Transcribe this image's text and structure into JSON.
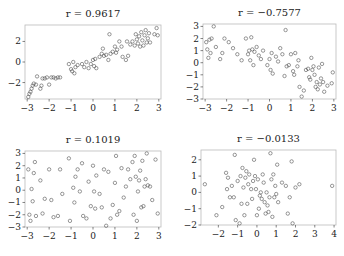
{
  "chart_data": [
    {
      "type": "scatter",
      "title": "r = 0.9617",
      "xlabel": "",
      "ylabel": "",
      "xlim": [
        -3.1,
        3.1
      ],
      "ylim": [
        -3.6,
        3.6
      ],
      "xticks": [
        -3,
        -2,
        -1,
        0,
        1,
        2,
        3
      ],
      "yticks": [
        -2,
        0,
        2
      ],
      "xtick_labels": [
        "−3",
        "−2",
        "−1",
        "0",
        "1",
        "2",
        "3"
      ],
      "ytick_labels": [
        "−2",
        "0",
        "2"
      ],
      "box": [
        25,
        25,
        161,
        99
      ],
      "points": [
        [
          -2.95,
          -3.4
        ],
        [
          -2.9,
          -3.1
        ],
        [
          -2.85,
          -2.9
        ],
        [
          -2.8,
          -2.6
        ],
        [
          -2.75,
          -2.3
        ],
        [
          -2.7,
          -2.1
        ],
        [
          -2.6,
          -2.2
        ],
        [
          -2.55,
          -1.4
        ],
        [
          -2.4,
          -2.6
        ],
        [
          -2.35,
          -2.3
        ],
        [
          -2.3,
          -1.6
        ],
        [
          -2.2,
          -1.6
        ],
        [
          -2.1,
          -1.5
        ],
        [
          -2.0,
          -2.2
        ],
        [
          -1.9,
          -1.5
        ],
        [
          -1.8,
          -1.5
        ],
        [
          -1.7,
          -1.6
        ],
        [
          -1.6,
          -1.5
        ],
        [
          -1.5,
          -1.5
        ],
        [
          -1.1,
          -0.2
        ],
        [
          -1.0,
          -0.7
        ],
        [
          -0.95,
          -0.9
        ],
        [
          -0.9,
          0.0
        ],
        [
          -0.85,
          -1.1
        ],
        [
          -0.8,
          -0.5
        ],
        [
          -0.7,
          -0.3
        ],
        [
          -0.5,
          -0.2
        ],
        [
          -0.4,
          -0.5
        ],
        [
          -0.3,
          0.0
        ],
        [
          -0.2,
          -0.6
        ],
        [
          -0.1,
          -0.2
        ],
        [
          0.0,
          0.2
        ],
        [
          0.05,
          -0.4
        ],
        [
          0.1,
          0.3
        ],
        [
          0.15,
          -0.6
        ],
        [
          0.3,
          0.5
        ],
        [
          0.4,
          0.8
        ],
        [
          0.45,
          1.3
        ],
        [
          0.5,
          0.6
        ],
        [
          0.6,
          0.7
        ],
        [
          0.7,
          0.2
        ],
        [
          0.75,
          2.7
        ],
        [
          0.8,
          0.8
        ],
        [
          0.9,
          1.0
        ],
        [
          1.0,
          1.5
        ],
        [
          1.05,
          0.9
        ],
        [
          1.1,
          1.2
        ],
        [
          1.2,
          2.0
        ],
        [
          1.3,
          1.5
        ],
        [
          1.35,
          0.5
        ],
        [
          1.5,
          0.2
        ],
        [
          1.55,
          2.0
        ],
        [
          1.6,
          0.6
        ],
        [
          1.7,
          1.7
        ],
        [
          1.8,
          2.0
        ],
        [
          1.9,
          1.6
        ],
        [
          1.95,
          2.7
        ],
        [
          2.0,
          2.2
        ],
        [
          2.05,
          1.8
        ],
        [
          2.1,
          2.5
        ],
        [
          2.15,
          1.5
        ],
        [
          2.2,
          2.9
        ],
        [
          2.25,
          2.1
        ],
        [
          2.3,
          1.6
        ],
        [
          2.35,
          2.6
        ],
        [
          2.4,
          3.1
        ],
        [
          2.45,
          1.9
        ],
        [
          2.5,
          2.3
        ],
        [
          2.55,
          2.8
        ],
        [
          2.6,
          1.9
        ],
        [
          2.8,
          2.7
        ],
        [
          2.9,
          3.3
        ],
        [
          2.95,
          2.6
        ]
      ]
    },
    {
      "type": "scatter",
      "title": "r = −0.7577",
      "xlabel": "",
      "ylabel": "",
      "xlim": [
        -3.1,
        3.1
      ],
      "ylim": [
        -3.0,
        3.2
      ],
      "xticks": [
        -3,
        -2,
        -1,
        0,
        1,
        2,
        3
      ],
      "yticks": [
        -3,
        -2,
        -1,
        0,
        1,
        2,
        3
      ],
      "xtick_labels": [
        "−3",
        "−2",
        "−1",
        "0",
        "1",
        "2",
        "3"
      ],
      "ytick_labels": [
        "−3",
        "−2",
        "−1",
        "0",
        "1",
        "2",
        "3"
      ],
      "box": [
        203,
        24,
        336,
        99
      ],
      "points": [
        [
          -2.95,
          1.7
        ],
        [
          -2.9,
          1.1
        ],
        [
          -2.85,
          0.4
        ],
        [
          -2.8,
          1.9
        ],
        [
          -2.75,
          0.8
        ],
        [
          -2.7,
          2.0
        ],
        [
          -2.6,
          3.0
        ],
        [
          -2.5,
          1.3
        ],
        [
          -2.3,
          0.3
        ],
        [
          -2.2,
          0.8
        ],
        [
          -2.1,
          2.0
        ],
        [
          -1.9,
          1.7
        ],
        [
          -1.7,
          1.2
        ],
        [
          -1.5,
          0.7
        ],
        [
          -1.3,
          0.2
        ],
        [
          -1.1,
          2.0
        ],
        [
          -1.0,
          0.7
        ],
        [
          -0.95,
          1.0
        ],
        [
          -0.9,
          0.2
        ],
        [
          -0.85,
          2.1
        ],
        [
          -0.8,
          1.1
        ],
        [
          -0.75,
          -0.2
        ],
        [
          -0.7,
          0.9
        ],
        [
          -0.6,
          1.3
        ],
        [
          -0.5,
          0.6
        ],
        [
          -0.4,
          0.3
        ],
        [
          -0.3,
          1.0
        ],
        [
          -0.1,
          -0.2
        ],
        [
          0.0,
          0.3
        ],
        [
          0.05,
          -0.6
        ],
        [
          0.1,
          0.8
        ],
        [
          0.15,
          -0.9
        ],
        [
          0.3,
          0.5
        ],
        [
          0.4,
          0.1
        ],
        [
          0.5,
          1.2
        ],
        [
          0.6,
          0.7
        ],
        [
          0.7,
          -1.1
        ],
        [
          0.75,
          2.7
        ],
        [
          0.8,
          -0.3
        ],
        [
          0.9,
          -0.2
        ],
        [
          1.0,
          0.7
        ],
        [
          1.1,
          -0.7
        ],
        [
          1.15,
          -1.0
        ],
        [
          1.2,
          0.8
        ],
        [
          1.3,
          -0.3
        ],
        [
          1.35,
          0.2
        ],
        [
          1.4,
          -2.0
        ],
        [
          1.5,
          -2.8
        ],
        [
          1.6,
          -2.3
        ],
        [
          1.7,
          -0.6
        ],
        [
          1.8,
          -0.5
        ],
        [
          1.85,
          -1.2
        ],
        [
          1.9,
          -1.4
        ],
        [
          1.95,
          0.4
        ],
        [
          2.0,
          -0.6
        ],
        [
          2.05,
          -0.3
        ],
        [
          2.1,
          -1.0
        ],
        [
          2.15,
          -2.0
        ],
        [
          2.2,
          -1.6
        ],
        [
          2.25,
          -2.2
        ],
        [
          2.3,
          -0.4
        ],
        [
          2.35,
          -1.8
        ],
        [
          2.4,
          -1.3
        ],
        [
          2.45,
          -0.1
        ],
        [
          2.5,
          -1.6
        ],
        [
          2.55,
          -2.4
        ],
        [
          2.7,
          -1.9
        ],
        [
          2.9,
          -1.7
        ],
        [
          2.95,
          -0.8
        ]
      ]
    },
    {
      "type": "scatter",
      "title": "r = 0.1019",
      "xlabel": "",
      "ylabel": "",
      "xlim": [
        -3.1,
        3.1
      ],
      "ylim": [
        -3.0,
        3.2
      ],
      "xticks": [
        -3,
        -2,
        -1,
        0,
        1,
        2,
        3
      ],
      "yticks": [
        -3,
        -2,
        -1,
        0,
        1,
        2,
        3
      ],
      "xtick_labels": [
        "−3",
        "−2",
        "−1",
        "0",
        "1",
        "2",
        "3"
      ],
      "ytick_labels": [
        "−3",
        "−2",
        "−1",
        "0",
        "1",
        "2",
        "3"
      ],
      "box": [
        25,
        151,
        161,
        227
      ],
      "points": [
        [
          -2.95,
          1.7
        ],
        [
          -2.9,
          -2.0
        ],
        [
          -2.85,
          -2.5
        ],
        [
          -2.8,
          0.1
        ],
        [
          -2.75,
          -0.9
        ],
        [
          -2.7,
          1.4
        ],
        [
          -2.65,
          2.3
        ],
        [
          -2.6,
          -2.1
        ],
        [
          -2.4,
          0.8
        ],
        [
          -2.3,
          -1.9
        ],
        [
          -2.2,
          -0.7
        ],
        [
          -2.0,
          1.7
        ],
        [
          -1.9,
          -0.8
        ],
        [
          -1.8,
          -2.2
        ],
        [
          -1.6,
          -2.1
        ],
        [
          -1.5,
          1.7
        ],
        [
          -1.4,
          -0.3
        ],
        [
          -1.1,
          2.6
        ],
        [
          -1.05,
          -2.5
        ],
        [
          -0.9,
          0.2
        ],
        [
          -0.85,
          -1.0
        ],
        [
          -0.8,
          1.1
        ],
        [
          -0.7,
          1.7
        ],
        [
          -0.6,
          -0.1
        ],
        [
          -0.5,
          2.2
        ],
        [
          -0.45,
          -2.1
        ],
        [
          -0.3,
          -2.3
        ],
        [
          -0.2,
          0.7
        ],
        [
          -0.1,
          -1.3
        ],
        [
          0.0,
          2.0
        ],
        [
          0.05,
          -0.1
        ],
        [
          0.1,
          -1.5
        ],
        [
          0.15,
          1.2
        ],
        [
          0.3,
          -0.3
        ],
        [
          0.4,
          -1.4
        ],
        [
          0.5,
          1.7
        ],
        [
          0.6,
          -2.9
        ],
        [
          0.7,
          1.5
        ],
        [
          0.8,
          -2.3
        ],
        [
          0.9,
          -1.2
        ],
        [
          1.0,
          0.6
        ],
        [
          1.05,
          2.8
        ],
        [
          1.1,
          -2.0
        ],
        [
          1.2,
          -1.7
        ],
        [
          1.3,
          1.8
        ],
        [
          1.4,
          -0.6
        ],
        [
          1.5,
          0.3
        ],
        [
          1.6,
          1.7
        ],
        [
          1.7,
          0.9
        ],
        [
          1.8,
          2.3
        ],
        [
          1.85,
          -2.0
        ],
        [
          1.9,
          2.8
        ],
        [
          1.95,
          1.1
        ],
        [
          2.0,
          -2.5
        ],
        [
          2.05,
          -0.1
        ],
        [
          2.1,
          0.8
        ],
        [
          2.15,
          1.6
        ],
        [
          2.2,
          -1.4
        ],
        [
          2.25,
          2.4
        ],
        [
          2.3,
          -1.3
        ],
        [
          2.35,
          0.3
        ],
        [
          2.4,
          0.9
        ],
        [
          2.45,
          3.0
        ],
        [
          2.5,
          0.4
        ],
        [
          2.6,
          0.3
        ],
        [
          2.7,
          -0.8
        ],
        [
          2.85,
          2.5
        ],
        [
          2.95,
          -1.9
        ]
      ]
    },
    {
      "type": "scatter",
      "title": "r = −0.0133",
      "xlabel": "",
      "ylabel": "",
      "xlim": [
        -2.9,
        4.1
      ],
      "ylim": [
        -2.0,
        2.6
      ],
      "xticks": [
        -2,
        -1,
        0,
        1,
        2,
        3,
        4
      ],
      "yticks": [
        -2,
        -1,
        0,
        1,
        2
      ],
      "xtick_labels": [
        "−2",
        "−1",
        "0",
        "1",
        "2",
        "3",
        "4"
      ],
      "ytick_labels": [
        "−2",
        "−1",
        "0",
        "1",
        "2"
      ],
      "box": [
        201,
        150,
        336,
        225
      ],
      "points": [
        [
          -2.7,
          0.5
        ],
        [
          -2.1,
          -1.4
        ],
        [
          -1.8,
          -0.9
        ],
        [
          -1.6,
          1.2
        ],
        [
          -1.55,
          0.2
        ],
        [
          -1.5,
          0.9
        ],
        [
          -1.4,
          -0.3
        ],
        [
          -1.3,
          0.4
        ],
        [
          -1.2,
          -0.3
        ],
        [
          -1.15,
          2.3
        ],
        [
          -1.1,
          -1.7
        ],
        [
          -1.0,
          0.7
        ],
        [
          -0.9,
          -1.9
        ],
        [
          -0.85,
          1.0
        ],
        [
          -0.8,
          -0.7
        ],
        [
          -0.75,
          1.5
        ],
        [
          -0.7,
          0.3
        ],
        [
          -0.65,
          -1.4
        ],
        [
          -0.6,
          0.9
        ],
        [
          -0.55,
          1.3
        ],
        [
          -0.5,
          -0.7
        ],
        [
          -0.45,
          0.5
        ],
        [
          -0.4,
          1.1
        ],
        [
          -0.3,
          0.2
        ],
        [
          -0.25,
          -0.4
        ],
        [
          -0.2,
          0.7
        ],
        [
          -0.15,
          2.0
        ],
        [
          -0.1,
          1.0
        ],
        [
          -0.05,
          0.2
        ],
        [
          0.0,
          -1.4
        ],
        [
          0.05,
          0.8
        ],
        [
          0.1,
          -1.0
        ],
        [
          0.15,
          -0.2
        ],
        [
          0.2,
          0.0
        ],
        [
          0.25,
          -0.4
        ],
        [
          0.3,
          1.1
        ],
        [
          0.35,
          0.6
        ],
        [
          0.4,
          -0.6
        ],
        [
          0.45,
          -1.3
        ],
        [
          0.5,
          0.0
        ],
        [
          0.55,
          -0.8
        ],
        [
          0.6,
          -1.2
        ],
        [
          0.65,
          -0.3
        ],
        [
          0.7,
          2.4
        ],
        [
          0.75,
          0.8
        ],
        [
          0.8,
          -1.5
        ],
        [
          0.85,
          1.1
        ],
        [
          0.9,
          -0.3
        ],
        [
          0.95,
          0.4
        ],
        [
          1.0,
          -0.1
        ],
        [
          1.05,
          1.7
        ],
        [
          1.1,
          -0.6
        ],
        [
          1.3,
          0.6
        ],
        [
          1.5,
          0.4
        ],
        [
          1.6,
          -1.3
        ],
        [
          1.7,
          -0.3
        ],
        [
          1.8,
          1.9
        ],
        [
          1.85,
          -1.9
        ],
        [
          2.0,
          0.3
        ],
        [
          2.2,
          0.5
        ],
        [
          3.9,
          0.4
        ]
      ]
    }
  ]
}
